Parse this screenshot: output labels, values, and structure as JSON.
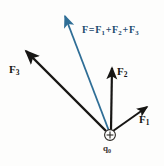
{
  "figure": {
    "kind": "physics-force-vector-diagram",
    "background_color": "#fdfdfc"
  },
  "colors": {
    "vector_black": "#171614",
    "resultant_blue": "#2f6e96",
    "resultant_text_blue": "#1b4a6e",
    "charge_outline": "#2b2824",
    "label_dark": "#171614"
  },
  "origin": {
    "name": "test-charge",
    "x": 110,
    "y": 135,
    "sign": "+",
    "label": "q",
    "label_sub": "0",
    "radius": 5.5
  },
  "vectors": [
    {
      "id": "F1",
      "label": "F",
      "label_sub": "1",
      "color": "#171614",
      "tip": {
        "x": 151,
        "y": 104
      },
      "tail": {
        "x": 113,
        "y": 131
      },
      "stroke_width": 2.0
    },
    {
      "id": "F2",
      "label": "F",
      "label_sub": "2",
      "color": "#171614",
      "tip": {
        "x": 112,
        "y": 63
      },
      "tail": {
        "x": 111,
        "y": 130
      },
      "stroke_width": 2.2
    },
    {
      "id": "F3",
      "label": "F",
      "label_sub": "3",
      "color": "#171614",
      "tip": {
        "x": 23,
        "y": 48
      },
      "tail": {
        "x": 106,
        "y": 131
      },
      "stroke_width": 2.4
    },
    {
      "id": "F",
      "label": "F",
      "label_sub": "",
      "color": "#2f6e96",
      "tip": {
        "x": 63,
        "y": 10
      },
      "tail": {
        "x": 109,
        "y": 131
      },
      "stroke_width": 1.8,
      "is_resultant": true
    }
  ],
  "equation": {
    "lhs": "F",
    "equals": "=",
    "terms": [
      {
        "base": "F",
        "sub": "1"
      },
      {
        "base": "F",
        "sub": "2"
      },
      {
        "base": "F",
        "sub": "3"
      }
    ],
    "plus": "+",
    "full_text": "F = F1 + F2 + F3",
    "color": "#1b4a6e"
  }
}
